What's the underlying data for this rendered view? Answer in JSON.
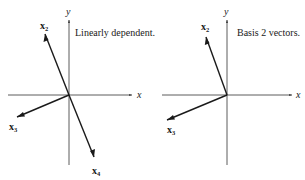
{
  "colors": {
    "ink": "#1a1a1a",
    "axis": "#333333",
    "background": "#ffffff"
  },
  "panels": [
    {
      "id": "left",
      "caption": "Linearly dependent.",
      "axes": {
        "x_label": "x",
        "y_label": "y"
      },
      "vectors": [
        {
          "name": "x",
          "sub": "2"
        },
        {
          "name": "x",
          "sub": "3"
        },
        {
          "name": "x",
          "sub": "4"
        }
      ]
    },
    {
      "id": "right",
      "caption": "Basis 2 vectors.",
      "axes": {
        "x_label": "x",
        "y_label": "y"
      },
      "vectors": [
        {
          "name": "x",
          "sub": "2"
        },
        {
          "name": "x",
          "sub": "3"
        }
      ]
    }
  ]
}
